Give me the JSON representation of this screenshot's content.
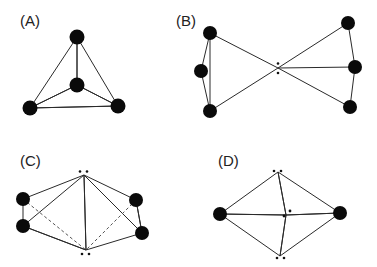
{
  "figure": {
    "panels": [
      {
        "id": "A",
        "label": "(A)",
        "geometry": "tetrahedral",
        "atoms": 4,
        "lone_pair_dots": 0
      },
      {
        "id": "B",
        "label": "(B)",
        "geometry": "two trigonal units joined at a central point",
        "atoms": 6,
        "lone_pair_dots": 2
      },
      {
        "id": "C",
        "label": "(C)",
        "geometry": "edge-sharing bipyramids (square planar-like)",
        "atoms": 4,
        "lone_pair_dots": 4
      },
      {
        "id": "D",
        "label": "(D)",
        "geometry": "linear with lone pairs (bipyramid)",
        "atoms": 2,
        "lone_pair_dots": 6
      }
    ]
  },
  "colors": {
    "atom": "#0a0a0a",
    "edge": "#2a2a2a",
    "shade_dark": "#6e6e6e",
    "shade_light": "#f2f2f2"
  }
}
